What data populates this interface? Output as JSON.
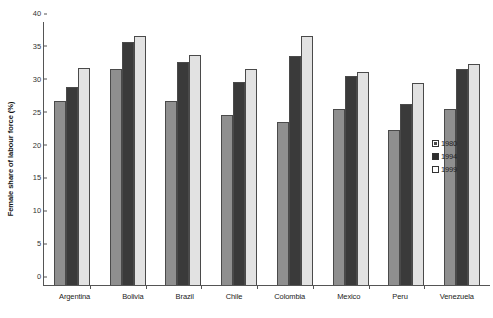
{
  "chart_data": {
    "type": "bar",
    "title": "",
    "xlabel": "",
    "ylabel": "Female share of labour force (%)",
    "ylim": [
      0,
      40
    ],
    "ytick_step": 5,
    "yticks": [
      40,
      35,
      30,
      25,
      20,
      15,
      10,
      5,
      0
    ],
    "grid": false,
    "legend_position": "right",
    "categories": [
      "Argentina",
      "Bolivia",
      "Brazil",
      "Chile",
      "Colombia",
      "Mexico",
      "Peru",
      "Venezuela"
    ],
    "series": [
      {
        "name": "1980",
        "color": "#8f8f8f",
        "values": [
          27.9,
          32.8,
          27.9,
          25.7,
          24.7,
          26.7,
          23.5,
          26.7
        ]
      },
      {
        "name": "1994",
        "color": "#3a3a3a",
        "values": [
          30.0,
          36.8,
          33.8,
          30.8,
          34.7,
          31.7,
          27.4,
          32.7
        ]
      },
      {
        "name": "1999",
        "color": "#e2e2e2",
        "values": [
          32.9,
          37.8,
          34.8,
          32.7,
          37.7,
          32.3,
          30.6,
          33.5
        ]
      }
    ]
  },
  "legend": {
    "items": [
      {
        "label": "1980"
      },
      {
        "label": "1994"
      },
      {
        "label": "1999"
      }
    ]
  }
}
